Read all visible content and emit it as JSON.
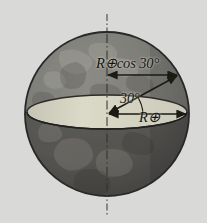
{
  "figure": {
    "background_color": "#d8d8d6",
    "sphere": {
      "center_x": 107,
      "center_y": 114,
      "radius": 82,
      "upper_hemisphere_color": "#7d7d78",
      "lower_hemisphere_color": "#565552",
      "outline_color": "#2b2a28",
      "equatorial_plane_color": "#d6d4c4"
    },
    "axis": {
      "name": "rotation-axis",
      "style": "dash-dot",
      "color": "#3a3a38",
      "top_x": 107,
      "top_y": 14,
      "bottom_x": 107,
      "bottom_y": 216
    },
    "labels": {
      "r_cos": {
        "R": "R",
        "earth_symbol": "⊕",
        "cos": "cos",
        "angle": "30",
        "degree": "°",
        "full_text": "R⊕cos 30°"
      },
      "angle": {
        "value": "30",
        "degree": "°",
        "full_text": "30°"
      },
      "r_equator": {
        "R": "R",
        "earth_symbol": "⊕",
        "full_text": "R⊕"
      }
    },
    "arrows": {
      "r_cos_arrow": {
        "name": "r-cos-arrow",
        "type": "double-headed",
        "x1": 107,
        "y1": 75,
        "x2": 178,
        "y2": 75
      },
      "radial_arrow": {
        "name": "radial-line-30deg",
        "type": "double-headed",
        "x1": 107,
        "y1": 114,
        "x2": 178,
        "y2": 75
      },
      "r_equator_arrow": {
        "name": "r-equator-arrow",
        "type": "double-headed",
        "x1": 107,
        "y1": 114,
        "x2": 187,
        "y2": 114
      }
    },
    "angle_arc": {
      "name": "angle-arc-30",
      "radius": 34,
      "from_deg": 0,
      "to_deg": 29
    },
    "continents": [
      {
        "name": "landmass-north-upper"
      },
      {
        "name": "landmass-africa"
      },
      {
        "name": "landmass-south"
      }
    ]
  }
}
